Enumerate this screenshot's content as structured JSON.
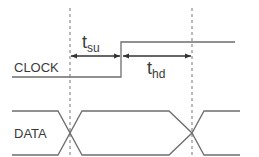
{
  "diagram": {
    "signals": [
      {
        "name": "CLOCK",
        "label": "CLOCK"
      },
      {
        "name": "DATA",
        "label": "DATA"
      }
    ],
    "annotations": {
      "setup": {
        "main": "t",
        "sub": "su"
      },
      "hold": {
        "main": "t",
        "sub": "hd"
      }
    },
    "colors": {
      "line": "#6e6e6e",
      "arrow": "#3a3a3a",
      "dash": "#777777",
      "text": "#3a3a3a"
    }
  }
}
